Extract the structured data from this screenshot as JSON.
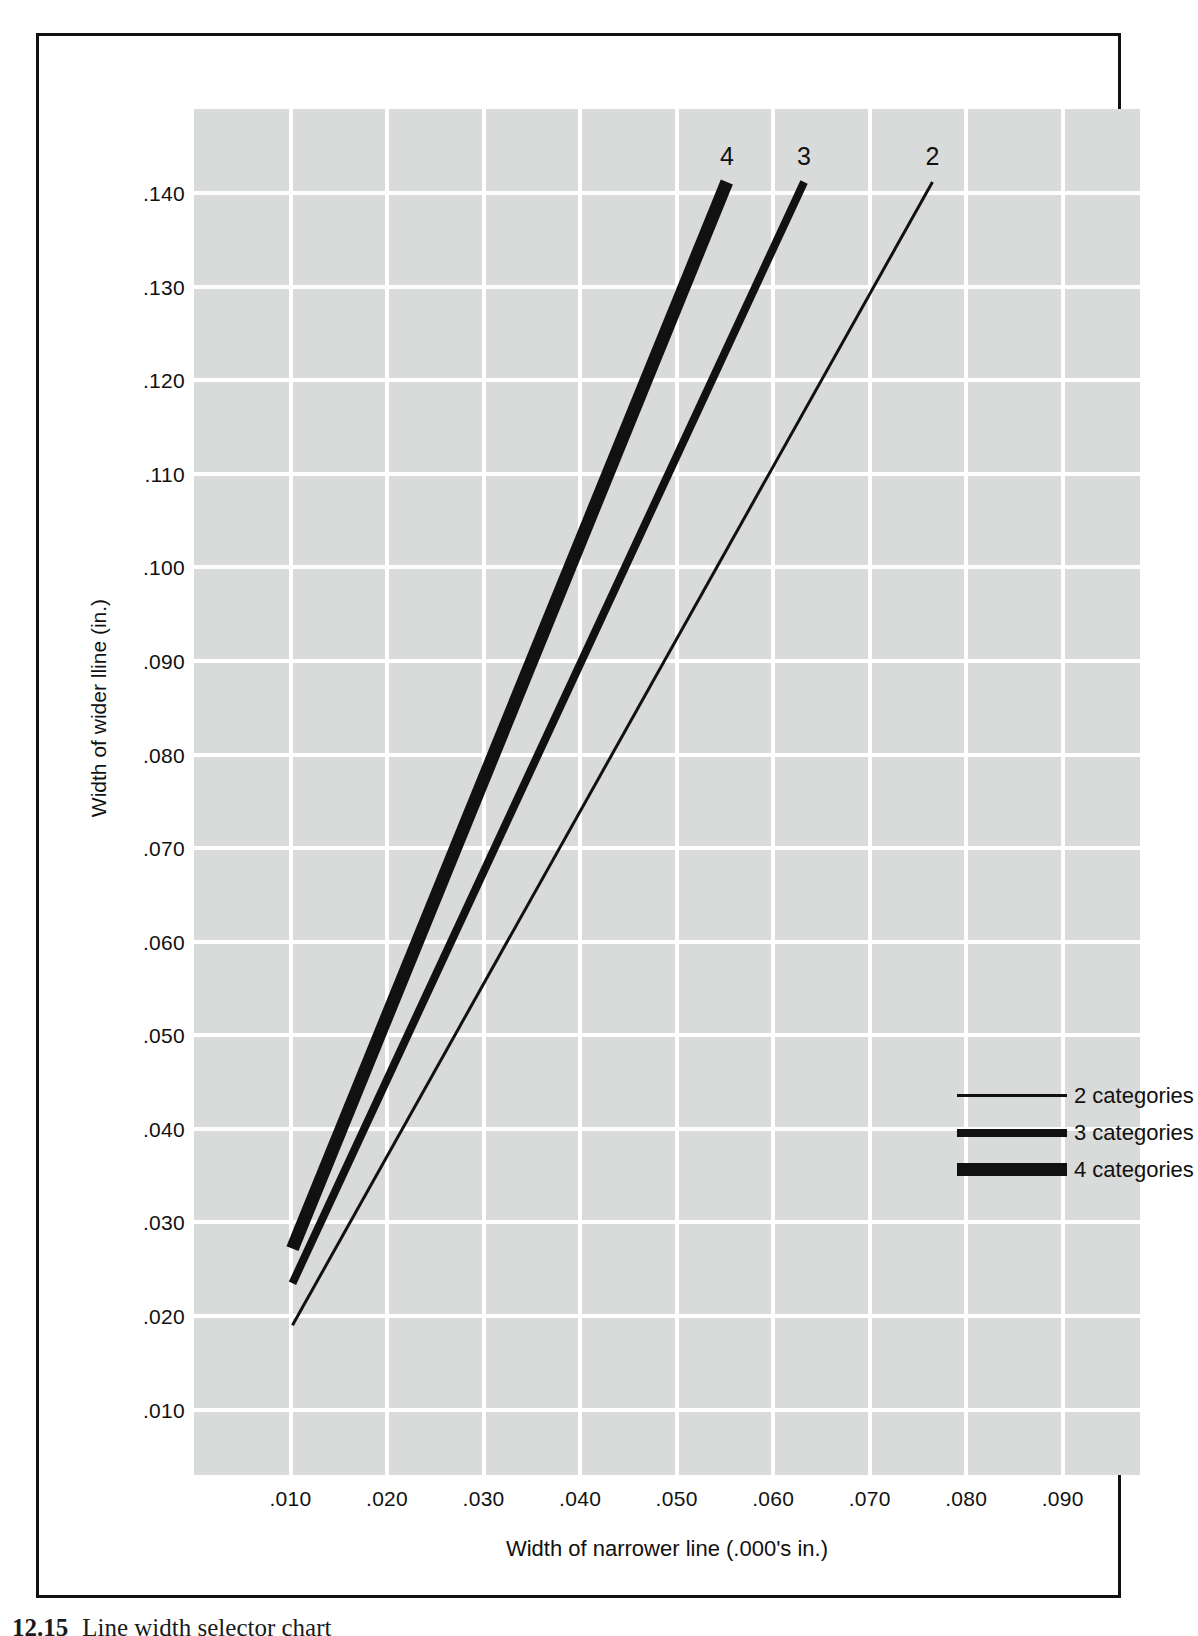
{
  "figure": {
    "caption_number": "12.15",
    "caption_text": "Line width selector chart"
  },
  "chart_data": {
    "type": "line",
    "title": "",
    "xlabel": "Width of narrower line (.000's in.)",
    "ylabel": "Width of wider lline (in.)",
    "xlim": [
      0.0,
      0.098
    ],
    "ylim": [
      0.003,
      0.149
    ],
    "grid": true,
    "grid_color": "#ffffff",
    "plot_background": "#d9dada",
    "line_color": "#111111",
    "xticks": [
      ".010",
      ".020",
      ".030",
      ".040",
      ".050",
      ".060",
      ".070",
      ".080",
      ".090"
    ],
    "xtick_values": [
      0.01,
      0.02,
      0.03,
      0.04,
      0.05,
      0.06,
      0.07,
      0.08,
      0.09
    ],
    "yticks": [
      ".010",
      ".020",
      ".030",
      ".040",
      ".050",
      ".060",
      ".070",
      ".080",
      ".090",
      ".100",
      ".110",
      ".120",
      ".130",
      ".140"
    ],
    "ytick_values": [
      0.01,
      0.02,
      0.03,
      0.04,
      0.05,
      0.06,
      0.07,
      0.08,
      0.09,
      0.1,
      0.11,
      0.12,
      0.13,
      0.14
    ],
    "legend_position": "center-right",
    "series": [
      {
        "name": "2 categories",
        "end_label": "2",
        "stroke_width_px": 3,
        "x": [
          0.0102,
          0.0765
        ],
        "y": [
          0.019,
          0.1412
        ]
      },
      {
        "name": "3 categories",
        "end_label": "3",
        "stroke_width_px": 8,
        "x": [
          0.0102,
          0.0632
        ],
        "y": [
          0.0235,
          0.1412
        ]
      },
      {
        "name": "4 categories",
        "end_label": "4",
        "stroke_width_px": 13,
        "x": [
          0.0102,
          0.0552
        ],
        "y": [
          0.0272,
          0.1412
        ]
      }
    ]
  },
  "legend": {
    "items": [
      {
        "label": "2 categories",
        "weight": "w1"
      },
      {
        "label": "3 categories",
        "weight": "w2"
      },
      {
        "label": "4 categories",
        "weight": "w3"
      }
    ]
  }
}
